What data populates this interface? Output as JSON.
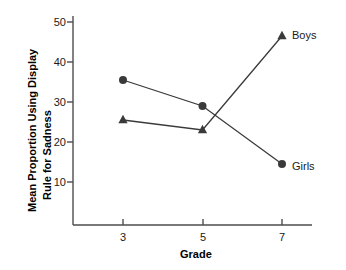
{
  "chart_data": {
    "type": "line",
    "title": "",
    "subtitle": "",
    "xlabel": "Grade",
    "ylabel": "Mean Proportion Using Display Rule for Sadness",
    "x": [
      3,
      5,
      7
    ],
    "categories": [
      "3",
      "5",
      "7"
    ],
    "xtick_labels": [
      "3",
      "5",
      "7"
    ],
    "ytick_labels": [
      "10",
      "20",
      "30",
      "40",
      "50"
    ],
    "yticks": [
      10,
      20,
      30,
      40,
      50
    ],
    "ylim": [
      5,
      52
    ],
    "xlim": [
      2.2,
      8.2
    ],
    "grid": false,
    "legend_position": "inline-right-of-last-point",
    "series": [
      {
        "name": "Boys",
        "marker": "triangle",
        "color": "#3a3a3a",
        "values": [
          25.5,
          23.0,
          46.5
        ],
        "label": "Boys"
      },
      {
        "name": "Girls",
        "marker": "circle",
        "color": "#3a3a3a",
        "values": [
          35.5,
          29.0,
          14.5
        ],
        "label": "Girls"
      }
    ],
    "annotations": []
  },
  "axes": {
    "y_title": "Mean Proportion Using Display Rule for Sadness",
    "y_title_line1": "Mean Proportion Using Display",
    "y_title_line2": "Rule for Sadness",
    "x_title": "Grade"
  },
  "labels": {
    "boys": "Boys",
    "girls": "Girls"
  },
  "ticks": {
    "y": [
      "50",
      "40",
      "30",
      "20",
      "10"
    ],
    "x": [
      "3",
      "5",
      "7"
    ]
  },
  "colors": {
    "axis": "#4d4d4d",
    "series": "#3a3a3a",
    "text": "#1a1a1a",
    "background": "#ffffff"
  }
}
